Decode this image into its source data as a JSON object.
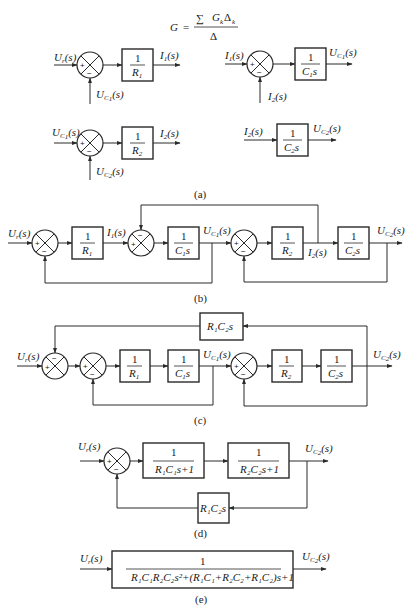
{
  "formula": {
    "lhs": "G",
    "eq": "=",
    "num_sigma": "∑",
    "num": "G",
    "num_sub_k": "k",
    "num_delta": "Δ",
    "num_delta_sub": "k",
    "den": "Δ"
  },
  "captions": {
    "a": "(a)",
    "b": "(b)",
    "c": "(c)",
    "d": "(d)",
    "e": "(e)"
  },
  "signals": {
    "Ur": "U",
    "Ur_sub": "r",
    "s": "(s)",
    "I1": "I",
    "I1_sub": "1",
    "I2": "I",
    "I2_sub": "2",
    "Uc1": "U",
    "Uc1_sub": "C",
    "Uc1_subsub": "1",
    "Uc2": "U",
    "Uc2_sub": "C",
    "Uc2_subsub": "2"
  },
  "blocks": {
    "one": "1",
    "R1": "R",
    "R1_sub": "1",
    "R2": "R",
    "R2_sub": "2",
    "C1s": "C",
    "C1s_sub": "1",
    "C1s_s": "s",
    "C2s": "C",
    "C2s_sub": "2",
    "C2s_s": "s",
    "R1C2s": "R₁C₂s",
    "d_block1_den": "R₁C₁s+1",
    "d_block2_den": "R₂C₂s+1",
    "d_feedback": "R₁C₂s",
    "e_num": "1",
    "e_den": "R₁C₁R₂C₂s²+(R₁C₁+R₂C₂+R₁C₂)s+1"
  },
  "signs": {
    "plus": "+",
    "minus": "−"
  },
  "colors": {
    "line": "#2a2a2a",
    "text": "#1a1a1a",
    "background": "#ffffff"
  }
}
